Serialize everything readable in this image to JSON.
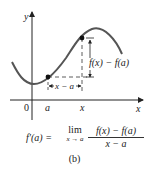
{
  "figure": {
    "caption": "(b)",
    "axes": {
      "x_label": "x",
      "y_label": "y",
      "origin_label": "0",
      "x_ticks": [
        "a",
        "x"
      ]
    },
    "annotations": {
      "vertical_difference": "f(x) − f(a)",
      "horizontal_difference": "x − a"
    },
    "points": [
      {
        "name": "a",
        "label": "(a, f(a))"
      },
      {
        "name": "x",
        "label": "(x, f(x))"
      }
    ],
    "formula": {
      "lhs": "f′(a) =",
      "lim": "lim",
      "lim_sub": "x → a",
      "numerator": "f(x) − f(a)",
      "denominator": "x − a"
    },
    "colors": {
      "curve": "#555555",
      "axis": "#222222",
      "text": "#222222"
    }
  }
}
